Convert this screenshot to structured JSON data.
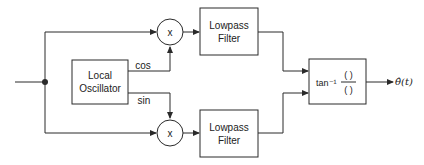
{
  "diagram": {
    "title": "",
    "blocks": {
      "local_oscillator": {
        "label": "Local\nOscillator"
      },
      "mixer_top": {
        "label": "x"
      },
      "mixer_bottom": {
        "label": "x"
      },
      "lpf_top": {
        "label": "Lowpass\nFilter"
      },
      "lpf_bottom": {
        "label": "Lowpass\nFilter"
      },
      "arctan": {
        "prefix": "tan⁻¹",
        "numerator": "( )",
        "denominator": "( )"
      }
    },
    "signals": {
      "cos": "cos",
      "sin": "sin",
      "output": "θ̂(t)"
    }
  },
  "colors": {
    "line": "#2a2a2a",
    "background": "#ffffff"
  }
}
